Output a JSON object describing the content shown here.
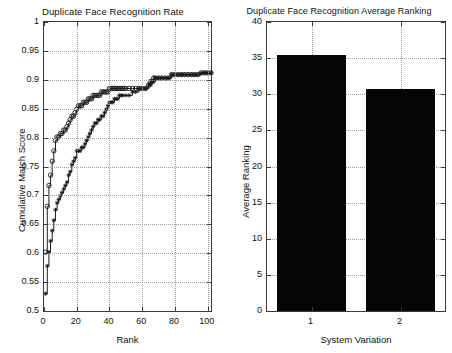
{
  "figure": {
    "background": "#ffffff",
    "axis_color": "#3a3a3a",
    "grid_color": "#9a9a9a",
    "bar_color": "#050505"
  },
  "panels": [
    {
      "id": "cumulative-match-characteristic",
      "title": "Duplicate Face Recognition Rate",
      "annotation": "166 duplicate face pairs",
      "xlabel": "Rank",
      "ylabel": "Cumulative Match Score",
      "xticks": [
        "0",
        "20",
        "40",
        "60",
        "80",
        "100"
      ],
      "yticks": [
        "0.5",
        "0.55",
        "0.6",
        "0.65",
        "0.7",
        "0.75",
        "0.8",
        "0.85",
        "0.9",
        "0.95",
        "1"
      ]
    },
    {
      "id": "average-ranking",
      "title": "Duplicate Face Recognition Average Ranking",
      "annotation": "166 duplicate face pairs",
      "xlabel": "System Variation",
      "ylabel": "Average Ranking",
      "xticks": [
        "1",
        "2"
      ],
      "yticks": [
        "0",
        "5",
        "10",
        "15",
        "20",
        "25",
        "30",
        "35",
        "40"
      ]
    }
  ],
  "chart_data": [
    {
      "type": "line",
      "title": "Duplicate Face Recognition Rate",
      "subtitle": "166 duplicate face pairs",
      "xlabel": "Rank",
      "ylabel": "Cumulative Match Score",
      "xlim": [
        0,
        102
      ],
      "ylim": [
        0.5,
        1
      ],
      "xticks": [
        0,
        20,
        40,
        60,
        80,
        100
      ],
      "yticks": [
        0.5,
        0.55,
        0.6,
        0.65,
        0.7,
        0.75,
        0.8,
        0.85,
        0.9,
        0.95,
        1
      ],
      "grid": true,
      "legend": "none",
      "series": [
        {
          "name": "System Variation 1 (circle markers)",
          "marker": "circle",
          "color": "#1a1a1a",
          "x": [
            1,
            2,
            3,
            4,
            5,
            6,
            7,
            8,
            9,
            10,
            11,
            12,
            13,
            14,
            15,
            16,
            17,
            18,
            19,
            20,
            21,
            22,
            23,
            24,
            25,
            26,
            27,
            28,
            29,
            30,
            31,
            32,
            33,
            34,
            35,
            36,
            37,
            38,
            39,
            40,
            41,
            42,
            43,
            44,
            45,
            46,
            47,
            48,
            49,
            50,
            52,
            54,
            56,
            58,
            60,
            62,
            64,
            65,
            66,
            67,
            68,
            70,
            72,
            74,
            76,
            78,
            80,
            82,
            84,
            86,
            88,
            90,
            92,
            94,
            96,
            98,
            100,
            102
          ],
          "y": [
            0.602,
            0.681,
            0.717,
            0.735,
            0.759,
            0.777,
            0.795,
            0.801,
            0.801,
            0.807,
            0.807,
            0.813,
            0.813,
            0.819,
            0.825,
            0.831,
            0.837,
            0.837,
            0.843,
            0.849,
            0.855,
            0.855,
            0.855,
            0.861,
            0.861,
            0.861,
            0.867,
            0.867,
            0.867,
            0.873,
            0.873,
            0.873,
            0.873,
            0.873,
            0.879,
            0.879,
            0.879,
            0.879,
            0.879,
            0.885,
            0.885,
            0.885,
            0.885,
            0.885,
            0.885,
            0.885,
            0.885,
            0.885,
            0.885,
            0.885,
            0.885,
            0.885,
            0.885,
            0.885,
            0.885,
            0.885,
            0.891,
            0.897,
            0.897,
            0.903,
            0.903,
            0.903,
            0.903,
            0.903,
            0.903,
            0.909,
            0.909,
            0.909,
            0.909,
            0.909,
            0.909,
            0.909,
            0.909,
            0.909,
            0.912,
            0.912,
            0.912,
            0.912
          ]
        },
        {
          "name": "System Variation 2 (star markers)",
          "marker": "star",
          "color": "#1a1a1a",
          "x": [
            1,
            2,
            3,
            4,
            5,
            6,
            7,
            8,
            9,
            10,
            11,
            12,
            13,
            14,
            15,
            16,
            17,
            18,
            19,
            20,
            21,
            22,
            23,
            24,
            25,
            26,
            27,
            28,
            29,
            30,
            31,
            32,
            33,
            34,
            35,
            36,
            37,
            38,
            39,
            40,
            41,
            42,
            43,
            44,
            45,
            46,
            47,
            48,
            50,
            52,
            54,
            56,
            58,
            60,
            62,
            64,
            65,
            66,
            67,
            68,
            70,
            72,
            74,
            76,
            78,
            80,
            82,
            84,
            86,
            88,
            90,
            92,
            94,
            96,
            98,
            100,
            102
          ],
          "y": [
            0.53,
            0.578,
            0.602,
            0.621,
            0.639,
            0.657,
            0.675,
            0.687,
            0.693,
            0.699,
            0.705,
            0.711,
            0.717,
            0.723,
            0.735,
            0.741,
            0.753,
            0.759,
            0.765,
            0.777,
            0.777,
            0.777,
            0.783,
            0.783,
            0.789,
            0.795,
            0.801,
            0.807,
            0.813,
            0.819,
            0.825,
            0.825,
            0.831,
            0.831,
            0.837,
            0.837,
            0.843,
            0.849,
            0.855,
            0.861,
            0.861,
            0.861,
            0.867,
            0.867,
            0.867,
            0.873,
            0.873,
            0.873,
            0.873,
            0.873,
            0.879,
            0.879,
            0.885,
            0.885,
            0.885,
            0.891,
            0.891,
            0.897,
            0.897,
            0.903,
            0.903,
            0.903,
            0.903,
            0.903,
            0.909,
            0.909,
            0.909,
            0.909,
            0.909,
            0.909,
            0.909,
            0.909,
            0.909,
            0.912,
            0.912,
            0.912,
            0.912
          ]
        }
      ]
    },
    {
      "type": "bar",
      "title": "Duplicate Face Recognition Average Ranking",
      "subtitle": "166 duplicate face pairs",
      "xlabel": "System Variation",
      "ylabel": "Average Ranking",
      "categories": [
        "1",
        "2"
      ],
      "values": [
        35.4,
        30.7
      ],
      "ylim": [
        0,
        40
      ],
      "yticks": [
        0,
        5,
        10,
        15,
        20,
        25,
        30,
        35,
        40
      ],
      "grid": true,
      "legend": "none",
      "bar_color": "#050505"
    }
  ]
}
